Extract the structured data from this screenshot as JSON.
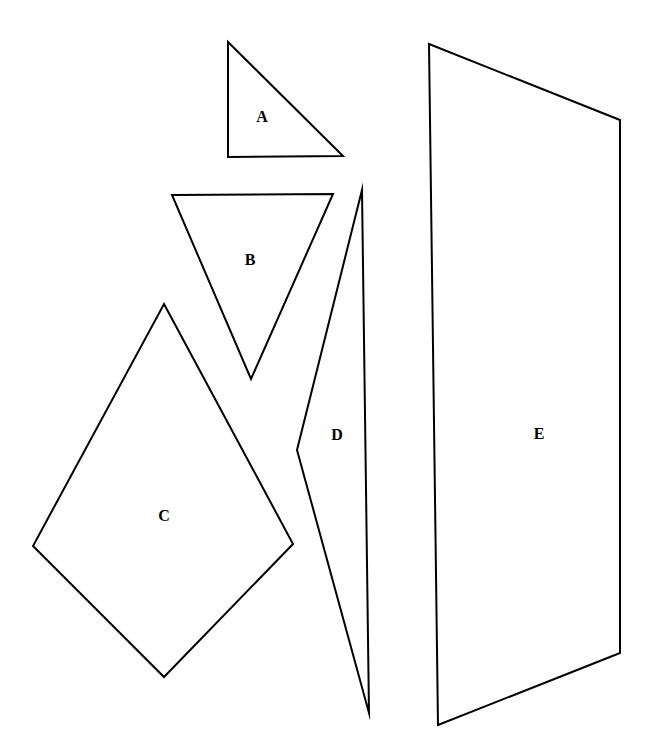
{
  "figure": {
    "width": 658,
    "height": 751,
    "background_color": "#ffffff",
    "stroke_color": "#000000",
    "label_color": "#000000",
    "stroke_width": 2,
    "shapes": [
      {
        "id": "shape-a",
        "label": "A",
        "kind": "right-triangle",
        "points": "228,42 343,156 228,157",
        "label_x": 262,
        "label_y": 118
      },
      {
        "id": "shape-b",
        "label": "B",
        "kind": "inverted-triangle",
        "points": "172,195 333,194 251,379",
        "label_x": 250,
        "label_y": 261
      },
      {
        "id": "shape-c",
        "label": "C",
        "kind": "kite-quadrilateral",
        "points": "164,304 293,544 164,677 33,546",
        "label_x": 164,
        "label_y": 517
      },
      {
        "id": "shape-d",
        "label": "D",
        "kind": "thin-sliver-quadrilateral",
        "points": "362,190 369,713 297,450",
        "label_x": 337,
        "label_y": 436
      },
      {
        "id": "shape-e",
        "label": "E",
        "kind": "trapezoid-quadrilateral",
        "points": "429,44 620,120 620,653 438,725",
        "label_x": 539,
        "label_y": 435
      }
    ]
  }
}
